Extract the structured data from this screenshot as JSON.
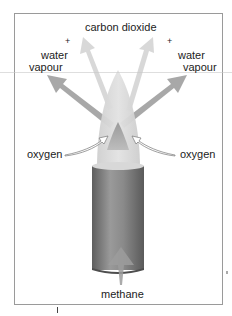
{
  "diagram": {
    "labels": {
      "carbon_dioxide": "carbon dioxide",
      "plus_left": "+",
      "plus_right": "+",
      "water_left_line1": "water",
      "water_left_line2": "vapour",
      "water_right_line1": "water",
      "water_right_line2": "vapour",
      "oxygen_left": "oxygen",
      "oxygen_right": "oxygen",
      "methane": "methane"
    },
    "colors": {
      "frame": "#9a9a9a",
      "arrow_gray": "#b4b4b4",
      "flame_outer": "#d6d6d6",
      "flame_inner": "#a8a8a8",
      "burner_dark": "#6e6e6e",
      "burner_light": "#9c9c9c",
      "text": "#1c1c1c"
    }
  }
}
